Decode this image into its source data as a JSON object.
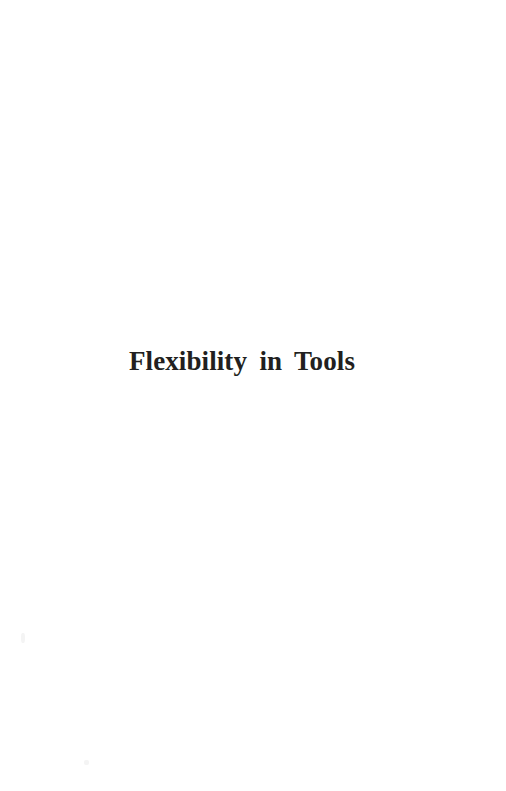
{
  "document": {
    "kind": "book-part-divider-page",
    "page_background_color": "#ffffff",
    "text_color": "#221f20"
  },
  "part_divider": {
    "title": "Flexibility in Tools"
  },
  "artifacts": {
    "speck_a_label": "",
    "speck_b_label": ""
  }
}
